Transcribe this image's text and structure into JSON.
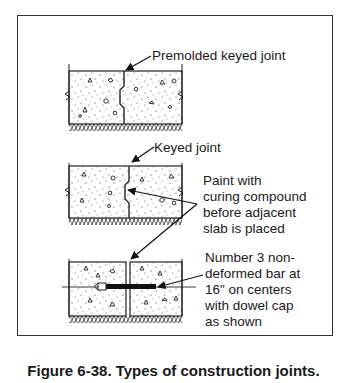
{
  "figure": {
    "caption": "Figure 6-38. Types of construction joints.",
    "panels": [
      {
        "id": "premolded-keyed-joint",
        "label": "Premolded keyed joint"
      },
      {
        "id": "keyed-joint",
        "label": "Keyed joint",
        "note_lines": [
          "Paint with",
          "curing compound",
          "before adjacent",
          "slab is placed"
        ]
      },
      {
        "id": "doweled-butt-joint",
        "note_lines": [
          "Number 3 non-",
          "deformed bar at",
          "16\" on centers",
          "with dowel cap",
          "as shown"
        ]
      }
    ]
  },
  "colors": {
    "ink": "#1a1a1a",
    "background": "#ffffff"
  }
}
